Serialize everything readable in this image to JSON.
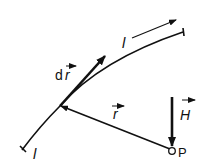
{
  "diagram": {
    "colors": {
      "stroke": "#111111",
      "background": "#ffffff"
    },
    "labels": {
      "path_top": "l",
      "path_bottom": "l",
      "line_element": "dr",
      "line_element_d": "d",
      "line_element_vec": "r",
      "position_vector": "r",
      "field": "H",
      "point": "P"
    },
    "elements": [
      {
        "id": "conductor-curve",
        "type": "curve"
      },
      {
        "id": "line-element-arrow",
        "type": "vector",
        "label": "dr"
      },
      {
        "id": "position-vector-arrow",
        "type": "vector",
        "label": "r"
      },
      {
        "id": "field-arrow",
        "type": "vector",
        "label": "H"
      },
      {
        "id": "direction-arrow",
        "type": "arrow",
        "label": "l"
      },
      {
        "id": "point-p",
        "type": "point",
        "label": "P"
      }
    ]
  }
}
